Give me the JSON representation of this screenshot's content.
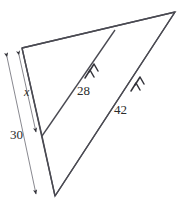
{
  "figure": {
    "type": "geometry-diagram",
    "background_color": "#ffffff",
    "stroke_color": "#4a4a52",
    "text_color": "#2b2b2b",
    "labels": {
      "segment_28": "28",
      "segment_42": "42",
      "dimension_30": "30",
      "dimension_x": "x"
    },
    "tick_marks": {
      "segment_28_arrows": 2,
      "segment_42_arrows": 2,
      "note": "double chevron marks indicating the two segments are parallel"
    },
    "vertices": {
      "top_left": [
        22,
        48
      ],
      "top_right": [
        175,
        12
      ],
      "bottom": [
        55,
        196
      ],
      "left_mid": [
        42,
        136
      ],
      "top_mid": [
        115,
        30
      ]
    },
    "dimension_lines": {
      "outer": {
        "label": "30",
        "from": [
          5,
          55
        ],
        "to": [
          37,
          196
        ]
      },
      "inner": {
        "label": "x",
        "from": [
          17,
          53
        ],
        "to": [
          37,
          134
        ]
      }
    }
  }
}
